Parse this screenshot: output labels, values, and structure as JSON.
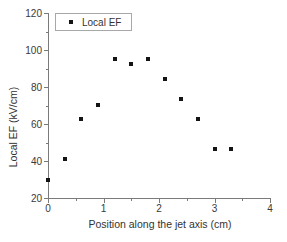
{
  "chart_data": {
    "type": "scatter",
    "title": "",
    "xlabel": "Position along the jet axis (cm)",
    "ylabel": "Local EF (kV/cm)",
    "xlim": [
      0,
      4
    ],
    "ylim": [
      20,
      120
    ],
    "x_major_ticks": [
      0,
      1,
      2,
      3,
      4
    ],
    "x_minor_step": 0.5,
    "y_major_ticks": [
      20,
      40,
      60,
      80,
      100,
      120
    ],
    "y_minor_step": 10,
    "grid": false,
    "legend": {
      "label": "Local EF",
      "position": "top-left"
    },
    "series": [
      {
        "name": "Local EF",
        "marker": "square",
        "color": "#141414",
        "points": [
          [
            0.0,
            30
          ],
          [
            0.3,
            41
          ],
          [
            0.6,
            62.5
          ],
          [
            0.9,
            70.5
          ],
          [
            1.2,
            95
          ],
          [
            1.5,
            92.5
          ],
          [
            1.8,
            95
          ],
          [
            2.1,
            84.5
          ],
          [
            2.4,
            73.5
          ],
          [
            2.7,
            62.5
          ],
          [
            3.0,
            46.5
          ],
          [
            3.3,
            46.5
          ]
        ]
      }
    ]
  },
  "colors": {
    "background": "#ffffff",
    "axis": "#7a7a7a",
    "text": "#333333",
    "marker": "#141414",
    "legend_border": "#a8a8a8"
  }
}
